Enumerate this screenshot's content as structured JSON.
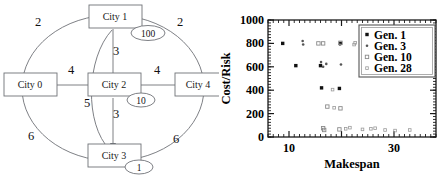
{
  "graph": {
    "title": "city-network-graph",
    "nodes": [
      {
        "id": "city0",
        "label": "City 0",
        "x": 30,
        "y": 85
      },
      {
        "id": "city1",
        "label": "City 1",
        "x": 122,
        "y": 12
      },
      {
        "id": "city2",
        "label": "City 2",
        "x": 112,
        "y": 85
      },
      {
        "id": "city3",
        "label": "City 3",
        "x": 112,
        "y": 152
      },
      {
        "id": "city4",
        "label": "City 4",
        "x": 196,
        "y": 85
      }
    ],
    "edge_weights": [
      {
        "id": "w-c0-c1",
        "value": "2",
        "x": 38,
        "y": 26
      },
      {
        "id": "w-c1-c4",
        "value": "2",
        "x": 180,
        "y": 26
      },
      {
        "id": "w-c0-c2",
        "value": "4",
        "x": 71,
        "y": 74
      },
      {
        "id": "w-c2-c4",
        "value": "4",
        "x": 157,
        "y": 74
      },
      {
        "id": "w-c1-c2",
        "value": "3",
        "x": 113,
        "y": 52
      },
      {
        "id": "w-c2-c3",
        "value": "3",
        "x": 113,
        "y": 114
      },
      {
        "id": "w-c1-c3",
        "value": "5",
        "x": 88,
        "y": 104
      },
      {
        "id": "w-c0-c3",
        "value": "6",
        "x": 32,
        "y": 135
      },
      {
        "id": "w-c3-c4",
        "value": "6",
        "x": 175,
        "y": 138
      }
    ],
    "bubbles": [
      {
        "id": "bubble-city1",
        "value": "100",
        "cx": 148,
        "cy": 33,
        "rx": 17,
        "ry": 7.5
      },
      {
        "id": "bubble-city2",
        "value": "10",
        "cx": 140,
        "cy": 100,
        "rx": 14,
        "ry": 7
      },
      {
        "id": "bubble-city3",
        "value": "1",
        "cx": 138,
        "cy": 166,
        "rx": 14,
        "ry": 7
      }
    ]
  },
  "chart_data": {
    "type": "scatter",
    "title": "",
    "xlabel": "Makespan",
    "ylabel": "Cost/Risk",
    "xlim": [
      6,
      38
    ],
    "ylim": [
      0,
      1000
    ],
    "xticks": [
      10,
      30
    ],
    "yticks": [
      0,
      200,
      400,
      600,
      800,
      1000
    ],
    "grid": false,
    "legend_position": "top-right",
    "series": [
      {
        "name": "Gen. 1",
        "marker": "filled-square",
        "color": "#111111",
        "points": [
          [
            8.8,
            800
          ],
          [
            11.3,
            610
          ],
          [
            16.0,
            610
          ],
          [
            16.2,
            420
          ],
          [
            19.8,
            800
          ],
          [
            19.6,
            415
          ]
        ]
      },
      {
        "name": "Gen. 3",
        "marker": "small-dot",
        "color": "#555555",
        "points": [
          [
            12.6,
            820
          ],
          [
            12.7,
            790
          ],
          [
            16.1,
            640
          ],
          [
            17.1,
            625
          ],
          [
            16.5,
            600
          ],
          [
            19.7,
            790
          ],
          [
            19.9,
            620
          ],
          [
            25.3,
            615
          ],
          [
            26.1,
            650
          ]
        ]
      },
      {
        "name": "Gen. 10",
        "marker": "open-square",
        "color": "#8a8a8a",
        "points": [
          [
            15.6,
            800
          ],
          [
            16.5,
            800
          ],
          [
            19.8,
            805
          ],
          [
            17.3,
            260
          ],
          [
            19.8,
            245
          ],
          [
            16.5,
            75
          ],
          [
            16.7,
            60
          ],
          [
            19.6,
            65
          ]
        ]
      },
      {
        "name": "Gen. 28",
        "marker": "tiny-square",
        "color": "#9a9a9a",
        "points": [
          [
            22.6,
            805
          ],
          [
            22.4,
            790
          ],
          [
            31.0,
            615
          ],
          [
            20.8,
            70
          ],
          [
            21.6,
            80
          ],
          [
            24.0,
            65
          ],
          [
            25.6,
            70
          ],
          [
            26.4,
            75
          ],
          [
            28.3,
            60
          ],
          [
            30.2,
            55
          ],
          [
            33.0,
            60
          ],
          [
            18.3,
            405
          ],
          [
            18.6,
            250
          ]
        ]
      }
    ],
    "legend_entries": [
      {
        "label": "Gen. 1",
        "marker": "filled-square"
      },
      {
        "label": "Gen. 3",
        "marker": "small-dot"
      },
      {
        "label": "Gen. 10",
        "marker": "open-square"
      },
      {
        "label": "Gen. 28",
        "marker": "tiny-square"
      }
    ]
  }
}
